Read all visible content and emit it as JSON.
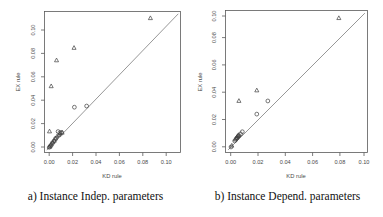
{
  "figure": {
    "panels": [
      {
        "id": "a",
        "caption": "a) Instance Indep. parameters",
        "xlabel": "KD rule",
        "ylabel": "EX rule"
      },
      {
        "id": "b",
        "caption": "b) Instance Depend. parameters",
        "xlabel": "KD rule",
        "ylabel": "EX rule"
      }
    ]
  },
  "chart_data": [
    {
      "type": "scatter",
      "panel": "a",
      "title": "a) Instance Indep. parameters",
      "xlabel": "KD rule",
      "ylabel": "EX rule",
      "xlim": [
        -0.004,
        0.118
      ],
      "ylim": [
        -0.004,
        0.118
      ],
      "xticks": [
        0.0,
        0.02,
        0.04,
        0.06,
        0.08,
        0.1
      ],
      "yticks": [
        0.0,
        0.02,
        0.04,
        0.06,
        0.08,
        0.1
      ],
      "xticklabels": [
        "0.00",
        "0.02",
        "0.04",
        "0.06",
        "0.08",
        "0.10"
      ],
      "yticklabels": [
        "0.00",
        "0.02",
        "0.04",
        "0.06",
        "0.08",
        "0.10"
      ],
      "grid": false,
      "reference_line": {
        "name": "y = x diagonal",
        "from": [
          -0.002,
          -0.002
        ],
        "to": [
          0.116,
          0.116
        ]
      },
      "series": [
        {
          "name": "triangle",
          "marker": "triangle",
          "points": [
            [
              0.0005,
              0.0142
            ],
            [
              0.002,
              0.0533
            ],
            [
              0.0068,
              0.0757
            ],
            [
              0.0225,
              0.0865
            ],
            [
              0.091,
              0.1122
            ],
            [
              0.0022,
              0.003
            ],
            [
              0.0035,
              0.0048
            ],
            [
              0.0048,
              0.0062
            ],
            [
              0.0058,
              0.008
            ],
            [
              0.0072,
              0.0098
            ],
            [
              0.0088,
              0.011
            ],
            [
              0.01,
              0.0122
            ],
            [
              0.0118,
              0.0131
            ],
            [
              0.0005,
              0.0008
            ],
            [
              0.0012,
              0.0018
            ]
          ]
        },
        {
          "name": "circle",
          "marker": "circle",
          "points": [
            [
              0.0228,
              0.0352
            ],
            [
              0.0338,
              0.0362
            ],
            [
              0.0082,
              0.0141
            ],
            [
              0.0098,
              0.0131
            ],
            [
              0.0113,
              0.0134
            ],
            [
              0.006,
              0.0082
            ],
            [
              0.0045,
              0.006
            ],
            [
              0.003,
              0.0042
            ],
            [
              0.0015,
              0.002
            ],
            [
              0.0003,
              0.0005
            ]
          ]
        }
      ]
    },
    {
      "type": "scatter",
      "panel": "b",
      "title": "b) Instance Depend. parameters",
      "xlabel": "KD rule",
      "ylabel": "EX rule",
      "xlim": [
        -0.004,
        0.104
      ],
      "ylim": [
        -0.004,
        0.104
      ],
      "xticks": [
        0.0,
        0.02,
        0.04,
        0.06,
        0.08,
        0.1
      ],
      "yticks": [
        0.0,
        0.02,
        0.04,
        0.06,
        0.08,
        0.1
      ],
      "xticklabels": [
        "0.00",
        "0.02",
        "0.04",
        "0.06",
        "0.08",
        "0.10"
      ],
      "yticklabels": [
        "0.00",
        "0.02",
        "0.04",
        "0.06",
        "0.08",
        "0.10"
      ],
      "grid": false,
      "reference_line": {
        "name": "y = x diagonal",
        "from": [
          -0.002,
          -0.002
        ],
        "to": [
          0.102,
          0.102
        ]
      },
      "series": [
        {
          "name": "triangle",
          "marker": "triangle",
          "points": [
            [
              0.0062,
              0.0352
            ],
            [
              0.0198,
              0.0432
            ],
            [
              0.0822,
              0.0982
            ],
            [
              0.0052,
              0.0085
            ],
            [
              0.006,
              0.0092
            ],
            [
              0.0045,
              0.0072
            ],
            [
              0.0035,
              0.0058
            ],
            [
              0.0008,
              0.0012
            ]
          ]
        },
        {
          "name": "circle",
          "marker": "circle",
          "points": [
            [
              0.0282,
              0.0352
            ],
            [
              0.0198,
              0.0252
            ],
            [
              0.0088,
              0.0118
            ],
            [
              0.0075,
              0.0102
            ],
            [
              0.0062,
              0.0088
            ],
            [
              0.0055,
              0.008
            ],
            [
              0.0048,
              0.0072
            ],
            [
              0.004,
              0.0062
            ],
            [
              0.003,
              0.0048
            ],
            [
              0.0002,
              0.0002
            ]
          ]
        }
      ]
    }
  ]
}
